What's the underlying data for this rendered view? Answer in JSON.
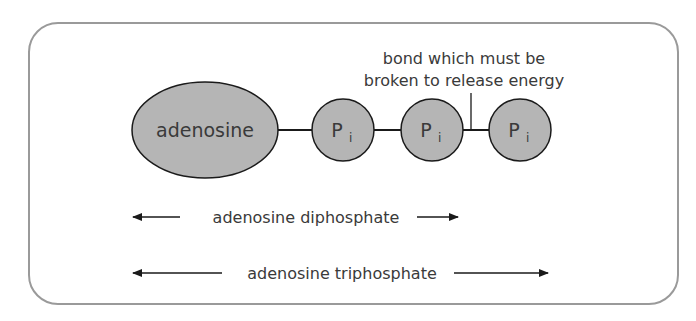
{
  "diagram": {
    "nodes": {
      "adenosine": "adenosine",
      "phosphate": "P",
      "phosphate_sub": "i"
    },
    "annotation": {
      "line1": "bond which must be",
      "line2": "broken to release energy"
    },
    "spans": {
      "adp": "adenosine diphosphate",
      "atp": "adenosine triphosphate"
    },
    "colors": {
      "node_fill": "#b5b5b5",
      "stroke": "#1a1a1a",
      "frame": "#9a9a9a",
      "text": "#3a3a3a"
    }
  }
}
